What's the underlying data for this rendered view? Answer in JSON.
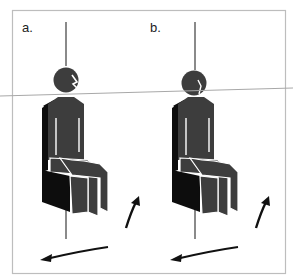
{
  "figure": {
    "panels": [
      {
        "id": "a",
        "label": "a.",
        "head_pose": "facing-forward"
      },
      {
        "id": "b",
        "label": "b.",
        "head_pose": "turned"
      }
    ],
    "colors": {
      "frame": "#bdbdbd",
      "axis": "#8a8a8a",
      "horizon_line": "#a8a8a8",
      "body": "#3d3d3d",
      "seat": "#0d0d0d",
      "outline": "#ffffff",
      "arrow": "#111111"
    },
    "icons": [
      "rotation-arrow-icon",
      "seated-person-icon"
    ]
  }
}
